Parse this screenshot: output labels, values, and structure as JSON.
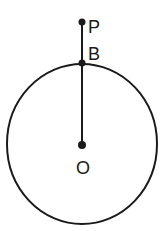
{
  "diagram": {
    "points": {
      "P": {
        "label": "P"
      },
      "B": {
        "label": "B"
      },
      "O": {
        "label": "O"
      }
    },
    "segments": [
      {
        "from": "P",
        "to": "B"
      },
      {
        "from": "B",
        "to": "O"
      }
    ],
    "circle": {
      "center": "O",
      "through": "B"
    },
    "colors": {
      "stroke": "#1a1a1a",
      "background": "#ffffff"
    }
  }
}
